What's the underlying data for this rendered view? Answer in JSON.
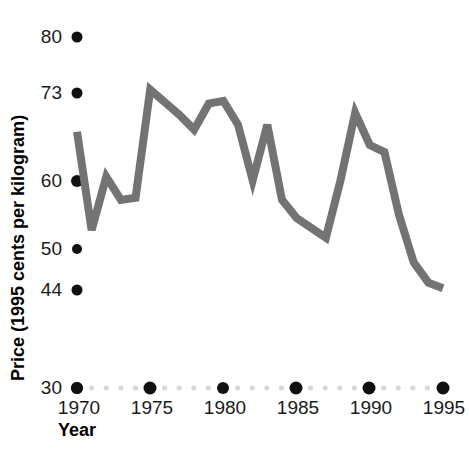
{
  "chart_data": {
    "type": "line",
    "title": "",
    "xlabel": "Year",
    "ylabel": "Price (1995 cents per kilogram)",
    "x": [
      1970,
      1971,
      1972,
      1973,
      1974,
      1975,
      1976,
      1977,
      1978,
      1979,
      1980,
      1981,
      1982,
      1983,
      1984,
      1985,
      1986,
      1987,
      1988,
      1989,
      1990,
      1991,
      1992,
      1993,
      1994,
      1995
    ],
    "values": [
      66.5,
      52.5,
      60.1,
      56.8,
      57.1,
      72.5,
      70.7,
      68.9,
      66.8,
      70.5,
      70.9,
      67.5,
      59.6,
      67.5,
      56.8,
      54.2,
      52.8,
      51.4,
      59.6,
      69.2,
      64.6,
      63.6,
      54.6,
      47.9,
      45.0,
      44.2
    ],
    "series": [
      {
        "name": "Price",
        "color": "#737373",
        "values": [
          66.5,
          52.5,
          60.1,
          56.8,
          57.1,
          72.5,
          70.7,
          68.9,
          66.8,
          70.5,
          70.9,
          67.5,
          59.6,
          67.5,
          56.8,
          54.2,
          52.8,
          51.4,
          59.6,
          69.2,
          64.6,
          63.6,
          54.6,
          47.9,
          45.0,
          44.2
        ]
      }
    ],
    "xlim": [
      1970,
      1995
    ],
    "ylim": [
      30,
      80
    ],
    "ytick_labels": [
      "80",
      "73",
      "60",
      "50",
      "44",
      "30"
    ],
    "ytick_values": [
      80,
      73,
      60,
      50,
      44,
      30
    ],
    "xtick_labels": [
      "1970",
      "1975",
      "1980",
      "1985",
      "1990",
      "1995"
    ],
    "xtick_values": [
      1970,
      1975,
      1980,
      1985,
      1990,
      1995
    ],
    "grid": false,
    "legend": "none",
    "axis_style": "dotted-marker-axis",
    "colors": {
      "line": "#737373",
      "tick_major": "#111111",
      "tick_minor": "#d8d8d8",
      "text": "#1a1a1a",
      "background": "#ffffff"
    }
  },
  "axis": {
    "y_title": "Price (1995 cents per kilogram)",
    "x_title": "Year"
  },
  "ylabels": {
    "t0": "80",
    "t1": "73",
    "t2": "60",
    "t3": "50",
    "t4": "44",
    "t5": "30"
  },
  "xlabels": {
    "t0": "1970",
    "t1": "1975",
    "t2": "1980",
    "t3": "1985",
    "t4": "1990",
    "t5": "1995"
  }
}
